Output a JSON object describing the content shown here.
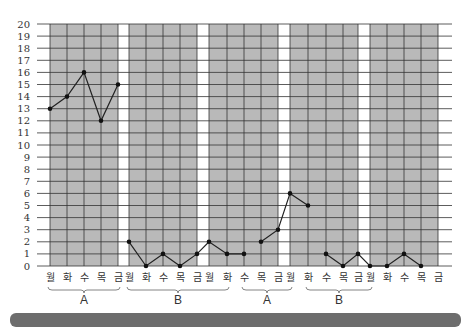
{
  "chart_data": {
    "type": "line",
    "title": "",
    "xlabel": "",
    "ylabel": "",
    "ylim": [
      0,
      20
    ],
    "yticks": [
      0,
      1,
      2,
      3,
      4,
      5,
      6,
      7,
      8,
      9,
      10,
      11,
      12,
      13,
      14,
      15,
      16,
      17,
      18,
      19,
      20
    ],
    "grid": true,
    "categories": [
      "월",
      "화",
      "수",
      "목",
      "금",
      "월",
      "화",
      "수",
      "목",
      "금",
      "월",
      "화",
      "수",
      "목",
      "금",
      "월",
      "화",
      "수",
      "목",
      "금",
      "월",
      "화",
      "수",
      "목",
      "금"
    ],
    "values": [
      13,
      14,
      16,
      12,
      15,
      2,
      0,
      1,
      0,
      1,
      1,
      2,
      1,
      1,
      2,
      3,
      6,
      5,
      1,
      0,
      1,
      0,
      0,
      1,
      0
    ],
    "points": [
      {
        "label": "월",
        "value": 13
      },
      {
        "label": "화",
        "value": 14
      },
      {
        "label": "수",
        "value": 16
      },
      {
        "label": "목",
        "value": 12
      },
      {
        "label": "금",
        "value": 15
      },
      {
        "label": "월",
        "value": 2
      },
      {
        "label": "화",
        "value": 0
      },
      {
        "label": "수",
        "value": 1
      },
      {
        "label": "목",
        "value": 0
      },
      {
        "label": "금",
        "value": 1
      },
      {
        "label": "월",
        "value": 2
      },
      {
        "label": "화",
        "value": 1
      },
      {
        "label": "수",
        "value": 1
      },
      {
        "label": "목",
        "value": 2
      },
      {
        "label": "금",
        "value": 3
      },
      {
        "label": "월",
        "value": 6
      },
      {
        "label": "화",
        "value": 5
      },
      {
        "label": "수",
        "value": 1
      },
      {
        "label": "목",
        "value": 0
      },
      {
        "label": "금",
        "value": 1
      },
      {
        "label": "월",
        "value": 0
      },
      {
        "label": "화",
        "value": 0
      },
      {
        "label": "수",
        "value": 1
      },
      {
        "label": "목",
        "value": 0
      },
      {
        "label": "금",
        "value": null
      }
    ],
    "series": [
      {
        "name": "segment-1",
        "x": [
          0,
          1,
          2,
          3,
          4
        ],
        "values": [
          13,
          14,
          16,
          12,
          15
        ]
      },
      {
        "name": "segment-2",
        "x": [
          5,
          6,
          7,
          8,
          9,
          10,
          11,
          12
        ],
        "values": [
          2,
          0,
          1,
          0,
          1,
          2,
          1,
          1
        ]
      },
      {
        "name": "segment-3",
        "x": [
          13,
          14,
          15,
          16
        ],
        "values": [
          2,
          3,
          6,
          5
        ]
      },
      {
        "name": "segment-4",
        "x": [
          17,
          18,
          19,
          20,
          21,
          22,
          23
        ],
        "values": [
          1,
          0,
          1,
          0,
          0,
          1,
          0
        ]
      }
    ],
    "phases": [
      {
        "label": "A",
        "start": 0,
        "end": 4
      },
      {
        "label": "B",
        "start": 5,
        "end": 11
      },
      {
        "label": "A",
        "start": 12,
        "end": 15
      },
      {
        "label": "B",
        "start": 16,
        "end": 20
      }
    ],
    "shaded_bands": [
      [
        0,
        4
      ],
      [
        5,
        9
      ],
      [
        10,
        14
      ],
      [
        15,
        19
      ],
      [
        20,
        24
      ]
    ]
  }
}
